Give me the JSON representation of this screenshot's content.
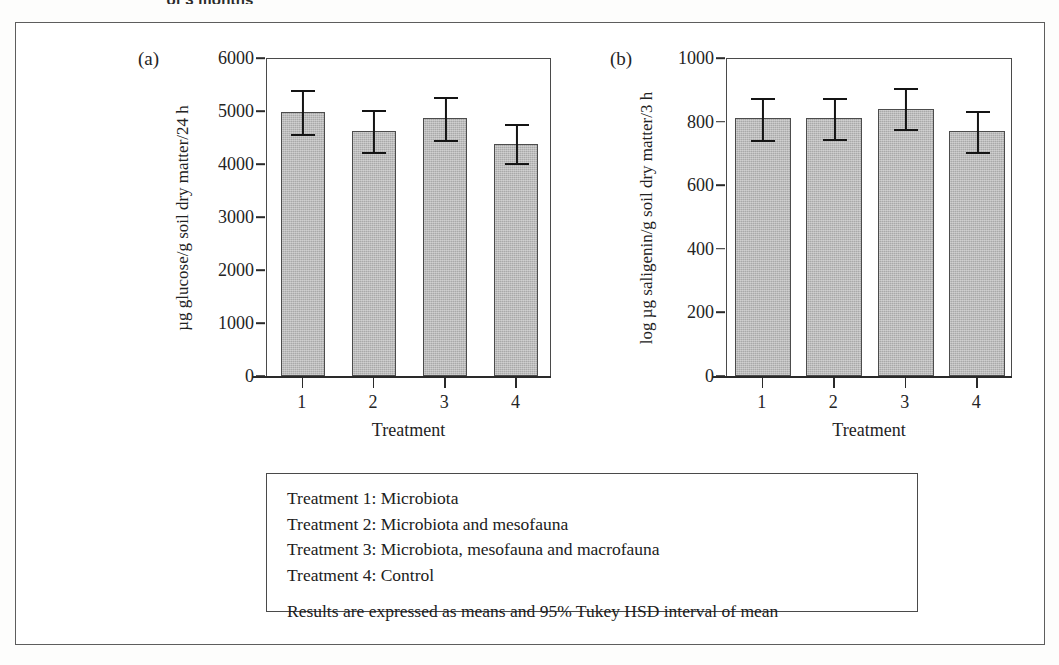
{
  "caption_fragment": "of 3 months",
  "panels": [
    {
      "tag": "(a)",
      "ylabel": "µg glucose/g soil dry matter/24 h",
      "xlabel": "Treatment",
      "yticks": [
        "6000",
        "5000",
        "4000",
        "3000",
        "2000",
        "1000",
        "0"
      ],
      "xticks": [
        "1",
        "2",
        "3",
        "4"
      ]
    },
    {
      "tag": "(b)",
      "ylabel": "log µg saligenin/g soil dry matter/3 h",
      "xlabel": "Treatment",
      "yticks": [
        "1000",
        "800",
        "600",
        "400",
        "200",
        "0"
      ],
      "xticks": [
        "1",
        "2",
        "3",
        "4"
      ]
    }
  ],
  "legend": {
    "lines": [
      "Treatment 1: Microbiota",
      "Treatment 2: Microbiota and mesofauna",
      "Treatment 3: Microbiota, mesofauna and macrofauna",
      "Treatment 4: Control"
    ],
    "note": "Results are expressed as means and 95% Tukey HSD interval of mean"
  },
  "colors": {
    "bar_fill": "#a9a9a9",
    "bar_edge": "#4c4c4c",
    "error_bar": "#141414",
    "frame": "#4a4a4a",
    "outer_rule": "#5d5d5d",
    "text": "#202020"
  },
  "chart_data": [
    {
      "type": "bar",
      "panel": "(a)",
      "title": "",
      "xlabel": "Treatment",
      "ylabel": "µg glucose/g soil dry matter/24 h",
      "categories": [
        "1",
        "2",
        "3",
        "4"
      ],
      "values": [
        4980,
        4620,
        4860,
        4380
      ],
      "error_low": [
        4550,
        4200,
        4430,
        4000
      ],
      "error_high": [
        5410,
        5040,
        5290,
        4770
      ],
      "error_type": "95% Tukey HSD interval of mean",
      "ylim": [
        0,
        6000
      ],
      "ytick_values": [
        0,
        1000,
        2000,
        3000,
        4000,
        5000,
        6000
      ],
      "grid": false,
      "legend": "none"
    },
    {
      "type": "bar",
      "panel": "(b)",
      "title": "",
      "xlabel": "Treatment",
      "ylabel": "log µg saligenin/g soil dry matter/3 h",
      "categories": [
        "1",
        "2",
        "3",
        "4"
      ],
      "values": [
        810,
        812,
        840,
        770
      ],
      "error_low": [
        740,
        742,
        772,
        700
      ],
      "error_high": [
        878,
        878,
        908,
        838
      ],
      "error_type": "95% Tukey HSD interval of mean",
      "ylim": [
        0,
        1000
      ],
      "ytick_values": [
        0,
        200,
        400,
        600,
        800,
        1000
      ],
      "grid": false,
      "legend": "none"
    }
  ]
}
